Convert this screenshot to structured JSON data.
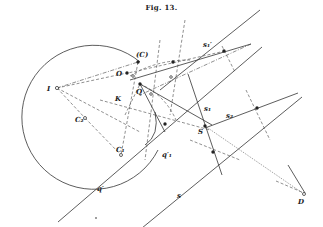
{
  "figure": {
    "title": "Fig. 13."
  },
  "labels": {
    "C_paren": "(C)",
    "O": "O",
    "Q": "Q",
    "K": "K",
    "I": "I",
    "C2": "C₂",
    "C1": "C₁",
    "q_prime": "q′",
    "q1_prime": "q′₁",
    "s1_prime": "s₁′",
    "s1": "s₁",
    "s2": "s₂",
    "S": "S",
    "s": "s",
    "D": "D"
  }
}
